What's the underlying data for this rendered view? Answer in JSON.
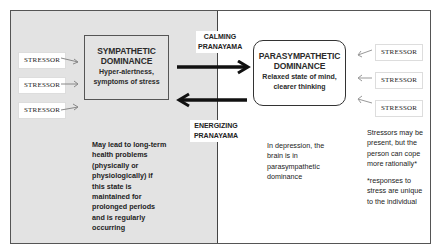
{
  "diagram": {
    "stressor_label": "STRESSOR",
    "left_stressors": [
      "STRESSOR",
      "STRESSOR",
      "STRESSOR"
    ],
    "right_stressors": [
      "STRESSOR",
      "STRESSOR",
      "STRESSOR"
    ],
    "sympathetic": {
      "title_line1": "SYMPATHETIC",
      "title_line2": "DOMINANCE",
      "sub_line1": "Hyper-alertness,",
      "sub_line2": "symptoms of stress"
    },
    "parasympathetic": {
      "title_line1": "PARASYMPATHETIC",
      "title_line2": "DOMINANCE",
      "sub_line1": "Relaxed state of mind,",
      "sub_line2": "clearer thinking"
    },
    "calming": {
      "line1": "CALMING",
      "line2": "PRANAYAMA"
    },
    "energizing": {
      "line1": "ENERGIZING",
      "line2": "PRANAYAMA"
    },
    "notes": {
      "left": [
        "May lead to long-term",
        "health problems",
        "(physically or",
        "physiologically) if",
        "this state is",
        "maintained for",
        "prolonged periods",
        "and is regularly",
        "occurring"
      ],
      "middle": [
        "In depression, the",
        "brain is in",
        "parasympathetic",
        "dominance"
      ],
      "right_a": [
        "Stressors may be",
        "present, but the",
        "person can cope",
        "more rationally*"
      ],
      "right_b": [
        "*responses to",
        "stress are unique",
        "to the individual"
      ]
    },
    "colors": {
      "left_panel": "#e3e3e3",
      "right_panel": "#ffffff",
      "arrow": "#111111"
    }
  }
}
